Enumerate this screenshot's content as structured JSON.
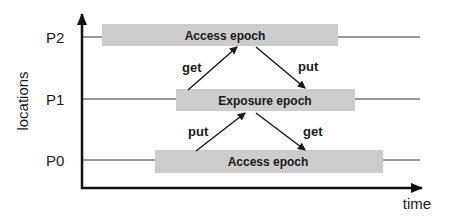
{
  "diagram": {
    "y_axis_label": "locations",
    "x_axis_label": "time",
    "rows": [
      {
        "id": "P2",
        "label": "P2",
        "epoch": "Access epoch"
      },
      {
        "id": "P1",
        "label": "P1",
        "epoch": "Exposure epoch"
      },
      {
        "id": "P0",
        "label": "P0",
        "epoch": "Access epoch"
      }
    ],
    "arrows": [
      {
        "label": "get",
        "from": "P1",
        "to": "P2"
      },
      {
        "label": "put",
        "from": "P2",
        "to": "P1"
      },
      {
        "label": "put",
        "from": "P0",
        "to": "P1"
      },
      {
        "label": "get",
        "from": "P1",
        "to": "P0"
      }
    ],
    "colors": {
      "box_fill": "#cccccc",
      "line": "#1a1a1a",
      "text": "#1a1a1a"
    }
  }
}
